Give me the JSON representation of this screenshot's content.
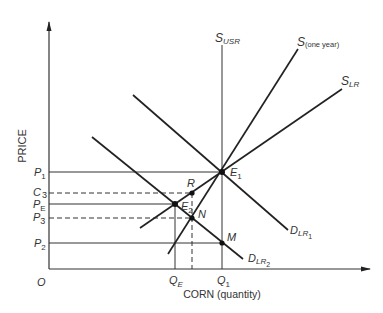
{
  "axes": {
    "y_label": "PRICE",
    "x_label": "CORN (quantity)",
    "origin": "O"
  },
  "price_levels": [
    {
      "id": "P1",
      "base": "P",
      "sub": "1",
      "y": 172,
      "style": "solid"
    },
    {
      "id": "C3",
      "base": "C",
      "sub": "3",
      "y": 193,
      "style": "dashed"
    },
    {
      "id": "PE",
      "base": "P",
      "sub": "E",
      "y": 204,
      "style": "solid"
    },
    {
      "id": "P3",
      "base": "P",
      "sub": "3",
      "y": 218,
      "style": "dashed"
    },
    {
      "id": "P2",
      "base": "P",
      "sub": "2",
      "y": 243,
      "style": "solid"
    }
  ],
  "quantity_levels": [
    {
      "id": "QE",
      "base": "Q",
      "sub": "E",
      "x": 175
    },
    {
      "id": "Q1",
      "base": "Q",
      "sub": "1",
      "x": 222
    }
  ],
  "curves": [
    {
      "id": "S_USR",
      "base": "S",
      "sub": "USR",
      "type": "supply",
      "desc": "vertical very-short-run supply"
    },
    {
      "id": "S_one_year",
      "base": "S",
      "sub": "(one year)",
      "type": "supply"
    },
    {
      "id": "S_LR",
      "base": "S",
      "sub": "LR",
      "type": "supply"
    },
    {
      "id": "D_LR1",
      "base": "D",
      "sub": "LR",
      "subsub": "1",
      "type": "demand"
    },
    {
      "id": "D_LR2",
      "base": "D",
      "sub": "LR",
      "subsub": "2",
      "type": "demand"
    }
  ],
  "points": [
    {
      "id": "E1",
      "base": "E",
      "sub": "1"
    },
    {
      "id": "E2",
      "base": "E",
      "sub": "2"
    },
    {
      "id": "R",
      "base": "R",
      "sub": ""
    },
    {
      "id": "N",
      "base": "N",
      "sub": ""
    },
    {
      "id": "M",
      "base": "M",
      "sub": ""
    }
  ]
}
